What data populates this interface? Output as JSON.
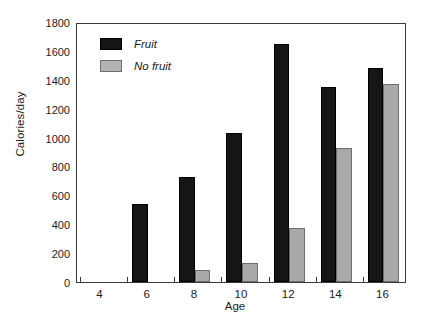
{
  "chart_data": {
    "type": "bar",
    "title": "",
    "xlabel": "Age",
    "ylabel": "Calories/day",
    "categories": [
      "4",
      "6",
      "8",
      "10",
      "12",
      "14",
      "16"
    ],
    "series": [
      {
        "name": "Fruit",
        "color": "#151515",
        "values": [
          0,
          540,
          730,
          1030,
          1650,
          1350,
          1480
        ]
      },
      {
        "name": "No fruit",
        "color": "#a9a9a9",
        "values": [
          0,
          0,
          85,
          130,
          375,
          930,
          1370
        ]
      }
    ],
    "ylim": [
      0,
      1800
    ],
    "yticks": [
      0,
      200,
      400,
      600,
      800,
      1000,
      1200,
      1400,
      1600,
      1800
    ],
    "xticks": [
      "4",
      "6",
      "8",
      "10",
      "12",
      "14",
      "16"
    ],
    "grid": false,
    "legend_position": "upper-left-inside"
  },
  "legend": {
    "items": [
      {
        "label": "Fruit",
        "swatch": "black-swatch"
      },
      {
        "label": "No fruit",
        "swatch": "gray-swatch"
      }
    ]
  }
}
